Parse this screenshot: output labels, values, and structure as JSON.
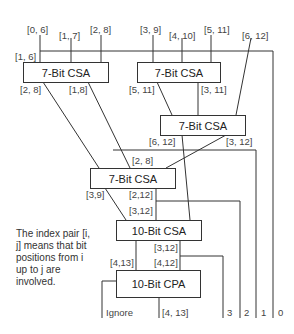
{
  "inputs": [
    "[0, 6]",
    "[1, 7]",
    "[2, 8]",
    "[3, 9]",
    "[4, 10]",
    "[5, 11]",
    "[6, 12]",
    "[1, 6]"
  ],
  "blocks": {
    "csa1": "7-Bit  CSA",
    "csa2": "7-Bit CSA",
    "csa3": "7-Bit CSA",
    "csa4": "7-Bit CSA",
    "csa10": "10-Bit CSA",
    "cpa10": "10-Bit CPA"
  },
  "labels": {
    "csa1_out_left": "[2, 8]",
    "csa1_out_right": "[1,8]",
    "csa2_out_left": "[5, 11]",
    "csa2_out_right": "[3, 11]",
    "csa3_out_left": "[6, 12]",
    "csa3_out_right": "[3, 12]",
    "csa4_in": "[2, 8]",
    "csa4_out_left": "[3,9]",
    "csa4_out_right1": "[2,12]",
    "csa4_out_right2": "[3,12]",
    "csa10_out_right1": "[3,12]",
    "csa10_out_left": "[4,13]",
    "csa10_out_right2": "[4,12]",
    "cpa_out_left": "Ignore",
    "cpa_out_right": "[4, 13]",
    "bit3": "3",
    "bit2": "2",
    "bit1": "1",
    "bit0": "0"
  },
  "note": "The index pair [i, j] means that bit positions from i up to j are involved."
}
